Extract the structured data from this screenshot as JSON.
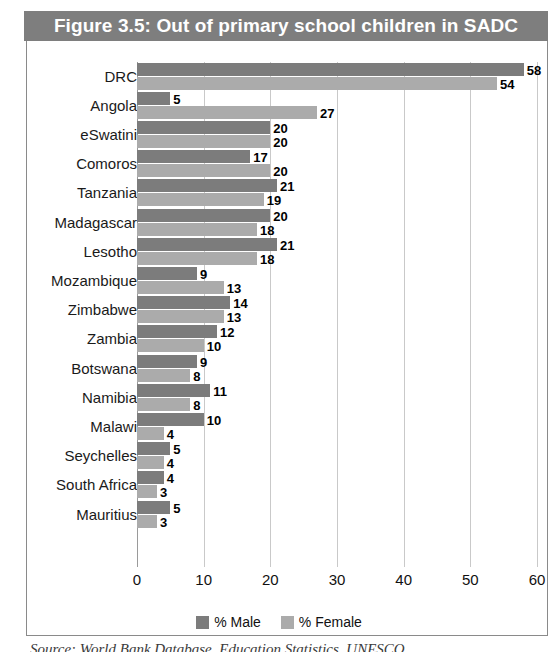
{
  "figure": {
    "title": "Figure 3.5: Out of primary school children in SADC",
    "source_caption": "Source: World Bank Database, Education Statistics, UNESCO"
  },
  "legend": {
    "male_label": "% Male",
    "female_label": "% Female",
    "male_color": "#7c7c7c",
    "female_color": "#ababab"
  },
  "chart_data": {
    "type": "bar",
    "orientation": "horizontal",
    "title": "Figure 3.5: Out of primary school children in SADC",
    "xlabel": "",
    "ylabel": "",
    "xlim": [
      0,
      60
    ],
    "xticks": [
      0,
      10,
      20,
      30,
      40,
      50,
      60
    ],
    "grid": true,
    "legend_position": "bottom",
    "categories": [
      "DRC",
      "Angola",
      "eSwatini",
      "Comoros",
      "Tanzania",
      "Madagascar",
      "Lesotho",
      "Mozambique",
      "Zimbabwe",
      "Zambia",
      "Botswana",
      "Namibia",
      "Malawi",
      "Seychelles",
      "South Africa",
      "Mauritius"
    ],
    "series": [
      {
        "name": "% Male",
        "color": "#7c7c7c",
        "values": [
          58,
          5,
          20,
          17,
          21,
          20,
          21,
          9,
          14,
          12,
          9,
          11,
          10,
          5,
          4,
          5
        ]
      },
      {
        "name": "% Female",
        "color": "#ababab",
        "values": [
          54,
          27,
          20,
          20,
          19,
          18,
          18,
          13,
          13,
          10,
          8,
          8,
          4,
          4,
          3,
          3
        ]
      }
    ]
  }
}
